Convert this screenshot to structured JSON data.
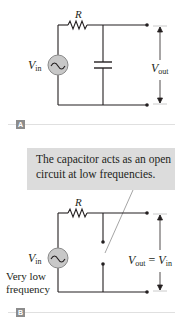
{
  "panel_a": {
    "tag": "A",
    "resistor_label": "R",
    "source_label": {
      "main": "V",
      "sub": "in"
    },
    "output_label": {
      "main": "V",
      "sub": "out"
    },
    "components": [
      "ac-source",
      "resistor",
      "capacitor",
      "output-terminals"
    ]
  },
  "callout": {
    "line1": "The capacitor acts as an open",
    "line2": "circuit at low frequencies."
  },
  "panel_b": {
    "tag": "B",
    "resistor_label": "R",
    "source_label": {
      "main": "V",
      "sub": "in"
    },
    "frequency_label": {
      "line1": "Very low",
      "line2": "frequency"
    },
    "output_label": {
      "main": "V",
      "sub": "out",
      "equals": "=",
      "rhs_main": "V",
      "rhs_sub": "in"
    },
    "components": [
      "ac-source",
      "resistor",
      "open-circuit",
      "output-terminals"
    ]
  },
  "colors": {
    "wire": "#231f20",
    "source_fill": "#c8c8c8",
    "callout_bg": "#dcdcdc",
    "tag_bg": "#8c8c8c",
    "rule": "#e0e0e0",
    "pointer": "#9a9a9a"
  }
}
